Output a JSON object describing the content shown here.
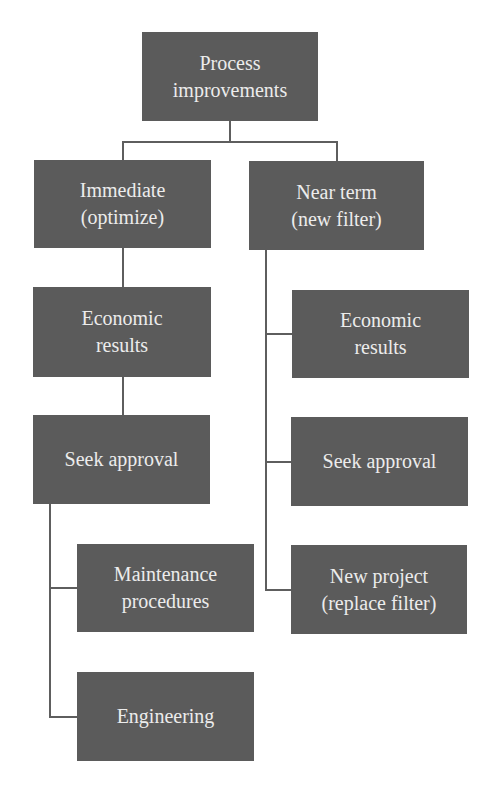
{
  "diagram": {
    "type": "hierarchy",
    "colors": {
      "background": "#ffffff",
      "node_fill": "#5b5b5b",
      "node_text": "#ececec",
      "connector": "#5e5e5e"
    },
    "root": {
      "label": "Process\nimprovements"
    },
    "branches": [
      {
        "label": "Immediate\n(optimize)",
        "children": [
          {
            "label": "Economic\nresults"
          },
          {
            "label": "Seek approval"
          },
          {
            "label": "Maintenance\nprocedures"
          },
          {
            "label": "Engineering"
          }
        ]
      },
      {
        "label": "Near term\n(new filter)",
        "children": [
          {
            "label": "Economic\nresults"
          },
          {
            "label": "Seek approval"
          },
          {
            "label": "New project\n(replace filter)"
          }
        ]
      }
    ]
  }
}
